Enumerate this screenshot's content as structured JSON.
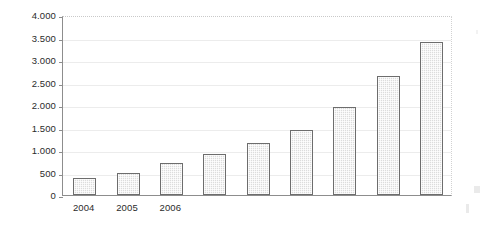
{
  "chart_data": {
    "type": "bar",
    "title": "",
    "subtitle": "",
    "xlabel": "",
    "ylabel": "",
    "categories": [
      "2004",
      "2005",
      "2006",
      "",
      "",
      "",
      "",
      "",
      ""
    ],
    "visible_category_labels": [
      "2004",
      "2005",
      "2006"
    ],
    "values": [
      380,
      500,
      720,
      920,
      1150,
      1450,
      1950,
      2650,
      3400
    ],
    "series": [
      {
        "name": "",
        "values": [
          380,
          500,
          720,
          920,
          1150,
          1450,
          1950,
          2650,
          3400
        ]
      }
    ],
    "ylim": [
      0,
      4000
    ],
    "ytick_values": [
      0,
      500,
      1000,
      1500,
      2000,
      2500,
      3000,
      3500,
      4000
    ],
    "ytick_labels": [
      "0",
      "500",
      "1.000",
      "1.500",
      "2.000",
      "2.500",
      "3.000",
      "3.500",
      "4.000"
    ],
    "grid": true,
    "grid_axis": "y",
    "legend": false,
    "legend_position": "none",
    "annotations": [],
    "bar_fill_color": "#dcdcdc",
    "bar_border_color": "#6d6d6d",
    "gridline_color": "#ececec",
    "axis_color": "#8d8d8d",
    "text_color": "#2b2b2b",
    "background_color": "#ffffff"
  }
}
